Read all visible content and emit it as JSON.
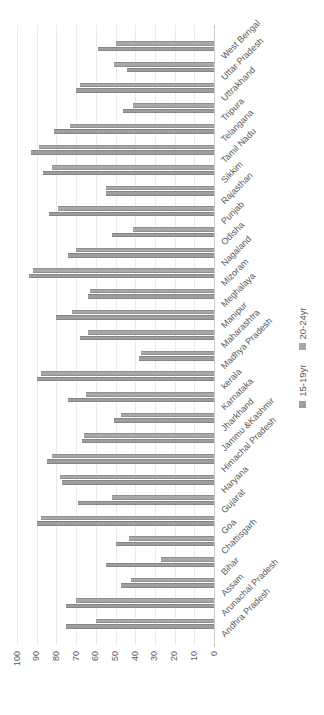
{
  "chart_data": {
    "type": "bar",
    "title": "",
    "xlabel": "",
    "ylabel": "",
    "ylim": [
      0,
      100
    ],
    "ytick_step": 10,
    "yticks": [
      0,
      10,
      20,
      30,
      40,
      50,
      60,
      70,
      80,
      90,
      100
    ],
    "grid": true,
    "legend_position": "bottom",
    "orientation": "vertical bars; whole chart image rotated 90 degrees counter-clockwise",
    "categories": [
      "Andhra Pradesh",
      "Arunachal Pradesh",
      "Assam",
      "Bihar",
      "Chattisgarh",
      "Goa",
      "Gujarat",
      "Haryana",
      "Himachal Pradesh",
      "Jammu &Kashmir",
      "Jharkhand",
      "Karnataka",
      "kerala",
      "Madhya Pradesh",
      "Maharashtra",
      "Manipur",
      "Meghalaya",
      "Mizoram",
      "Nagaland",
      "Odisha",
      "Punjab",
      "Rajasthan",
      "Sikkim",
      "Tamil Nadu",
      "Telangana",
      "Tripura",
      "Uttrakhand",
      "Uttar Pradesh",
      "West Bengal"
    ],
    "series": [
      {
        "name": "15-19yr",
        "color": "#9e9e9e",
        "values": [
          75,
          75,
          47,
          55,
          50,
          90,
          69,
          77,
          85,
          67,
          51,
          74,
          90,
          38,
          68,
          80,
          64,
          94,
          74,
          52,
          84,
          55,
          87,
          93,
          81,
          46,
          70,
          44,
          59
        ]
      },
      {
        "name": "20-24yr",
        "color": "#a8a8a8",
        "values": [
          60,
          70,
          42,
          27,
          43,
          88,
          52,
          78,
          82,
          66,
          47,
          65,
          88,
          37,
          64,
          72,
          63,
          92,
          70,
          41,
          79,
          55,
          82,
          89,
          73,
          41,
          68,
          51,
          50
        ]
      }
    ]
  },
  "style": {
    "text_color": "#595959",
    "grid_color": "#ebebeb",
    "axis_color": "#c9c9c9",
    "background": "#ffffff"
  },
  "legend": {
    "items": [
      "15-19yr",
      "20-24yr"
    ]
  }
}
